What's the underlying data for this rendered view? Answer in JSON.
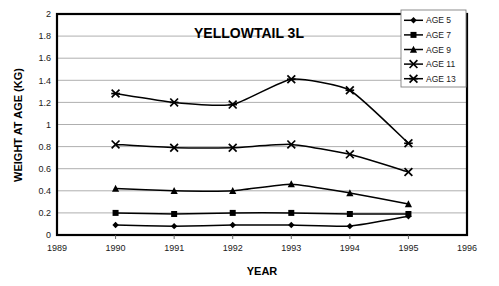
{
  "chart_data": {
    "type": "line",
    "title": "YELLOWTAIL 3L",
    "xlabel": "YEAR",
    "ylabel": "WEIGHT AT AGE (KG)",
    "x": [
      1990,
      1991,
      1992,
      1993,
      1994,
      1995
    ],
    "xlim": [
      1989,
      1996
    ],
    "ylim": [
      0,
      2
    ],
    "xticks": [
      1989,
      1990,
      1991,
      1992,
      1993,
      1994,
      1995,
      1996
    ],
    "yticks": [
      0,
      0.2,
      0.4,
      0.6,
      0.8,
      1,
      1.2,
      1.4,
      1.6,
      1.8,
      2
    ],
    "xtick_labels": [
      "1989",
      "1990",
      "1991",
      "1992",
      "1993",
      "1994",
      "1995",
      "1996"
    ],
    "ytick_labels": [
      "0",
      "0.2",
      "0.4",
      "0.6",
      "0.8",
      "1",
      "1.2",
      "1.4",
      "1.6",
      "1.8",
      "2"
    ],
    "grid": "horizontal",
    "legend_position": "top-right",
    "line_color": "#000000",
    "grid_color": "#a6a6a6",
    "axis_color": "#000000",
    "plot_background": "#ffffff",
    "series": [
      {
        "name": "AGE 5",
        "marker": "diamond",
        "values": [
          0.09,
          0.08,
          0.09,
          0.09,
          0.08,
          0.17
        ]
      },
      {
        "name": "AGE 7",
        "marker": "square",
        "values": [
          0.2,
          0.19,
          0.2,
          0.2,
          0.19,
          0.19
        ]
      },
      {
        "name": "AGE 9",
        "marker": "triangle",
        "values": [
          0.42,
          0.4,
          0.4,
          0.46,
          0.38,
          0.28
        ]
      },
      {
        "name": "AGE 11",
        "marker": "cross",
        "values": [
          0.82,
          0.79,
          0.79,
          0.82,
          0.73,
          0.57
        ]
      },
      {
        "name": "AGE 13",
        "marker": "asterisk",
        "values": [
          1.28,
          1.2,
          1.18,
          1.41,
          1.31,
          0.83
        ]
      }
    ]
  }
}
